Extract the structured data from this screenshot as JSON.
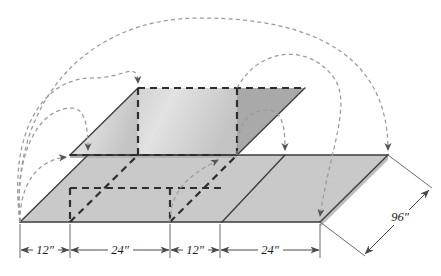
{
  "figure": {
    "kind": "isometric-engineering-drawing",
    "background_color": "#ffffff"
  },
  "colors": {
    "solid_edge": "#3b3b3b",
    "hidden_edge": "#2e2e2e",
    "arc_leader": "#9a9a9a",
    "dimension_line": "#4a4a4a",
    "top_face_light": "#dcdcdc",
    "top_face_dark": "#a9a9a9",
    "slab_face": "#c9c9c9",
    "slab_side": "#bdbdbd",
    "left_wall": "#b4b4b4",
    "text": "#1d1d1d"
  },
  "dimensions": {
    "chain_label": "horizontal dimension chain",
    "segments": [
      {
        "id": "seg-1",
        "label": "12″",
        "value": 12,
        "unit": "in",
        "text_x": 45,
        "text_y": 254,
        "x_start": 20,
        "x_end": 70
      },
      {
        "id": "seg-2",
        "label": "24″",
        "value": 24,
        "unit": "in",
        "text_x": 120,
        "text_y": 254,
        "x_start": 70,
        "x_end": 170
      },
      {
        "id": "seg-3",
        "label": "12″",
        "value": 12,
        "unit": "in",
        "text_x": 195,
        "text_y": 254,
        "x_start": 170,
        "x_end": 220
      },
      {
        "id": "seg-4",
        "label": "24″",
        "value": 24,
        "unit": "in",
        "text_x": 270,
        "text_y": 254,
        "x_start": 220,
        "x_end": 320
      }
    ],
    "depth": {
      "id": "depth-dim",
      "label": "96″",
      "value": 96,
      "unit": "in",
      "text_x": 400,
      "text_y": 220
    }
  },
  "geometry": {
    "slab": {
      "front_bottom_left": [
        20,
        222
      ],
      "front_bottom_right": [
        320,
        222
      ],
      "back_top_right": [
        388,
        155
      ],
      "back_top_left": [
        88,
        155
      ]
    },
    "raised_block": {
      "front_bottom_left": [
        70,
        155
      ],
      "front_bottom_right": [
        237,
        155
      ],
      "back_top_right": [
        305,
        88
      ],
      "back_top_left": [
        138,
        88
      ]
    }
  },
  "arcs": [
    {
      "id": "arc-1",
      "from": [
        20,
        222
      ],
      "to": [
        70,
        155
      ],
      "peak_y": 180
    },
    {
      "id": "arc-2",
      "from": [
        20,
        222
      ],
      "to": [
        88,
        155
      ],
      "peak_y": 108
    },
    {
      "id": "arc-3",
      "from": [
        20,
        222
      ],
      "to": [
        138,
        88
      ],
      "peak_y": 78
    },
    {
      "id": "arc-4",
      "from": [
        20,
        222
      ],
      "to": [
        388,
        155
      ],
      "peak_y": 18
    },
    {
      "id": "arc-5",
      "from": [
        170,
        222
      ],
      "to": [
        222,
        155
      ],
      "peak_y": 180
    },
    {
      "id": "arc-6",
      "from": [
        237,
        155
      ],
      "to": [
        285,
        155
      ],
      "peak_y": 112
    },
    {
      "id": "arc-7",
      "from": [
        305,
        88
      ],
      "to": [
        320,
        222
      ],
      "peak_y": 78
    }
  ]
}
